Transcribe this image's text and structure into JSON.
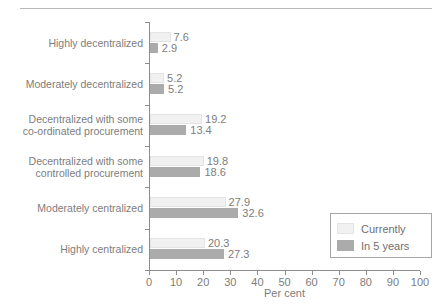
{
  "chart_data": {
    "type": "bar",
    "orientation": "horizontal",
    "title": "",
    "xlabel": "Per cent",
    "ylabel": "",
    "xlim": [
      0,
      100
    ],
    "xticks": [
      0,
      10,
      20,
      30,
      40,
      50,
      60,
      70,
      80,
      90,
      100
    ],
    "grid": false,
    "legend_position": "bottom-right",
    "categories": [
      "Highly decentralized",
      "Moderately decentralized",
      "Decentralized with some co-ordinated procurement",
      "Decentralized with some controlled procurement",
      "Moderately centralized",
      "Highly centralized"
    ],
    "category_lines": [
      [
        "Highly decentralized"
      ],
      [
        "Moderately decentralized"
      ],
      [
        "Decentralized with some",
        "co-ordinated procurement"
      ],
      [
        "Decentralized with some",
        "controlled procurement"
      ],
      [
        "Moderately centralized"
      ],
      [
        "Highly centralized"
      ]
    ],
    "series": [
      {
        "name": "Currently",
        "color": "#f1f1f1",
        "values": [
          7.6,
          5.2,
          19.2,
          19.8,
          27.9,
          20.3
        ],
        "labels": [
          "7.6",
          "5.2",
          "19.2",
          "19.8",
          "27.9",
          "20.3"
        ]
      },
      {
        "name": "In 5 years",
        "color": "#ababab",
        "values": [
          2.9,
          5.2,
          13.4,
          18.6,
          32.6,
          27.3
        ],
        "labels": [
          "2.9",
          "5.2",
          "13.4",
          "18.6",
          "32.6",
          "27.3"
        ]
      }
    ]
  },
  "axis": {
    "x_title": "Per cent",
    "tick_labels": [
      "0",
      "10",
      "20",
      "30",
      "40",
      "50",
      "60",
      "70",
      "80",
      "90",
      "100"
    ]
  },
  "legend": {
    "items": [
      {
        "label": "Currently"
      },
      {
        "label": "In 5 years"
      }
    ]
  }
}
